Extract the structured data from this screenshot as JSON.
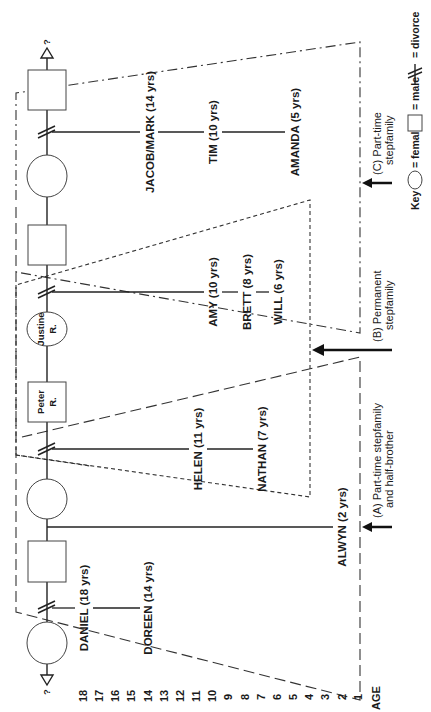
{
  "diagram": {
    "title": "",
    "age_axis": {
      "label": "AGE",
      "ticks": [
        "18",
        "17",
        "16",
        "15",
        "14",
        "13",
        "12",
        "11",
        "10",
        "9",
        "8",
        "7",
        "6",
        "5",
        "4",
        "3",
        "2",
        "1"
      ]
    },
    "lineage": {
      "top_unknown": "?",
      "bottom_unknown": "?",
      "members": [
        {
          "type": "male",
          "label": ""
        },
        {
          "type": "female",
          "label": ""
        },
        {
          "type": "male",
          "label": ""
        },
        {
          "type": "female",
          "label_line1": "Justine",
          "label_line2": "R."
        },
        {
          "type": "male",
          "label_line1": "Peter",
          "label_line2": "R."
        },
        {
          "type": "female",
          "label": ""
        },
        {
          "type": "male",
          "label": ""
        },
        {
          "type": "female",
          "label": ""
        }
      ]
    },
    "children": {
      "group_c": [
        "JACOB/MARK (14 yrs)",
        "TIM (10 yrs)",
        "AMANDA (5 yrs)"
      ],
      "group_b_justine": [
        "AMY (10 yrs)",
        "BRETT (8 yrs)",
        "WILL (6 yrs)"
      ],
      "group_b_peter": [
        "HELEN (11 yrs)",
        "NATHAN (7 yrs)"
      ],
      "alwyn": "ALWYN (2 yrs)",
      "group_a": [
        "DANIEL (18 yrs)",
        "DOREEN (14 yrs)"
      ]
    },
    "stepfamilies": {
      "a": {
        "line1": "(A) Part-time stepfamily",
        "line2": "and half-brother"
      },
      "b": {
        "line1": "(B) Permanent",
        "line2": "stepfamily"
      },
      "c": {
        "line1": "(C) Part-time",
        "line2": "stepfamily"
      }
    },
    "key": {
      "title": "Key",
      "female": "= female",
      "male": "= male",
      "divorce": "= divorce"
    }
  }
}
